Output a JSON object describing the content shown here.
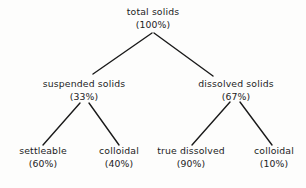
{
  "diagram": {
    "type": "hierarchy-tree",
    "line_color": "#1a1a1a",
    "background_color": "#ffffff",
    "text_color": "#1c1c1c",
    "nodes": {
      "root": {
        "label": "total solids",
        "value": "(100%)",
        "percent": 100
      },
      "suspended": {
        "label": "suspended solids",
        "value": "(33%)",
        "percent": 33
      },
      "dissolved": {
        "label": "dissolved solids",
        "value": "(67%)",
        "percent": 67
      },
      "settleable": {
        "label": "settleable",
        "value": "(60%)",
        "percent": 60
      },
      "colloidal_suspended": {
        "label": "colloidal",
        "value": "(40%)",
        "percent": 40
      },
      "true_dissolved": {
        "label": "true dissolved",
        "value": "(90%)",
        "percent": 90
      },
      "colloidal_dissolved": {
        "label": "colloidal",
        "value": "(10%)",
        "percent": 10
      }
    },
    "edges": [
      {
        "from": "root",
        "to": "suspended"
      },
      {
        "from": "root",
        "to": "dissolved"
      },
      {
        "from": "suspended",
        "to": "settleable"
      },
      {
        "from": "suspended",
        "to": "colloidal_suspended"
      },
      {
        "from": "dissolved",
        "to": "true_dissolved"
      },
      {
        "from": "dissolved",
        "to": "colloidal_dissolved"
      }
    ]
  }
}
